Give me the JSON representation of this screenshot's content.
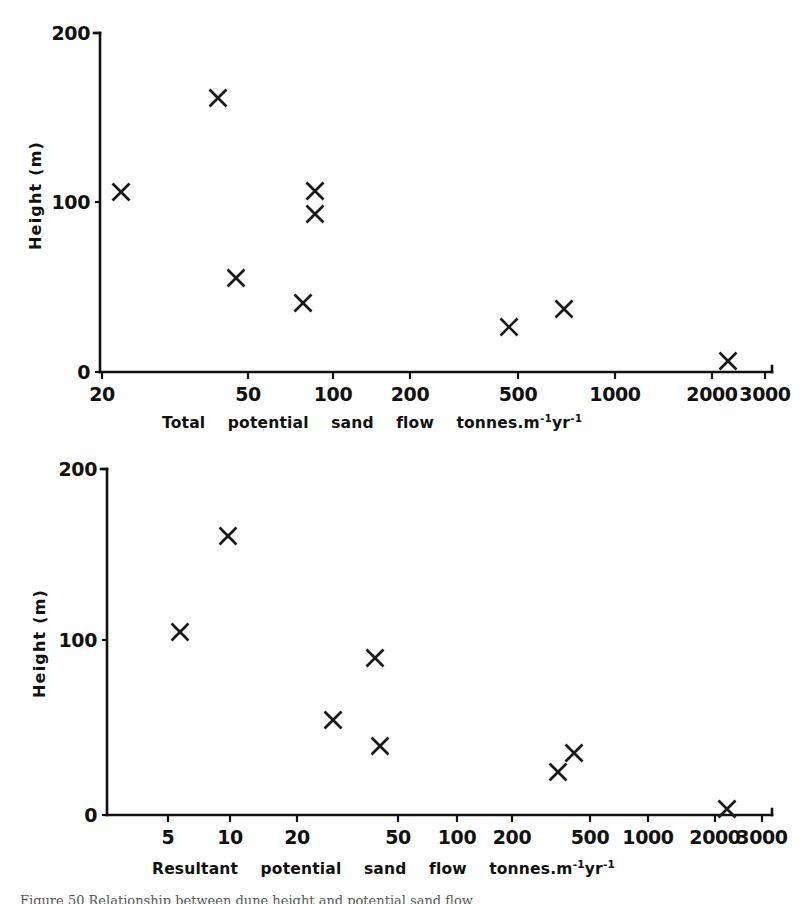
{
  "figure": {
    "caption": "Figure 50  Relationship between dune height and potential sand flow",
    "marker_glyph": "x-cross-marker",
    "ink_color": "#111111",
    "background_color": "#ffffff"
  },
  "chart_data": [
    {
      "id": "top",
      "type": "scatter",
      "title": "",
      "xlabel": "Total  potential  sand  flow   tonnes.m-1 yr-1",
      "xlabel_parts": [
        "Total",
        "potential",
        "sand",
        "flow",
        "tonnes.m"
      ],
      "xlabel_sup1": "-1",
      "xlabel_mid": "yr",
      "xlabel_sup2": "-1",
      "ylabel": "Height  (m)",
      "xscale": "log",
      "yscale": "linear",
      "xlim": [
        20,
        3000
      ],
      "ylim": [
        0,
        200
      ],
      "grid": false,
      "legend": "none",
      "xticks": [
        20,
        50,
        100,
        200,
        500,
        1000,
        2000,
        3000
      ],
      "xtick_labels": [
        "20",
        "50",
        "100",
        "200",
        "500",
        "1000",
        "2000",
        "3000"
      ],
      "xtick_px": [
        102,
        248,
        333,
        410,
        518,
        615,
        712,
        765
      ],
      "yticks": [
        0,
        100,
        200
      ],
      "ytick_labels": [
        "0",
        "100",
        "200"
      ],
      "ytick_px": [
        372,
        202,
        33
      ],
      "axis_x_px": 100,
      "axis_y0_px": 372,
      "axis_y_top_px": 33,
      "axis_x_right_px": 772,
      "points": [
        {
          "x": 25,
          "y": 105,
          "px": 121,
          "py": 192
        },
        {
          "x": 40,
          "y": 159,
          "px": 218,
          "py": 98
        },
        {
          "x": 45,
          "y": 54,
          "px": 236,
          "py": 278
        },
        {
          "x": 80,
          "y": 40,
          "px": 303,
          "py": 303
        },
        {
          "x": 88,
          "y": 106,
          "px": 315,
          "py": 191
        },
        {
          "x": 88,
          "y": 92,
          "px": 315,
          "py": 214
        },
        {
          "x": 470,
          "y": 27,
          "px": 509,
          "py": 327
        },
        {
          "x": 730,
          "y": 37,
          "px": 564,
          "py": 309
        },
        {
          "x": 2300,
          "y": 4,
          "px": 728,
          "py": 361
        }
      ]
    },
    {
      "id": "bottom",
      "type": "scatter",
      "title": "",
      "xlabel": "Resultant  potential  sand  flow   tonnes.m-1 yr-1",
      "xlabel_parts": [
        "Resultant",
        "potential",
        "sand",
        "flow",
        "tonnes.m"
      ],
      "xlabel_sup1": "-1",
      "xlabel_mid": "yr",
      "xlabel_sup2": "-1",
      "ylabel": "Height  (m)",
      "xscale": "log",
      "yscale": "linear",
      "xlim": [
        3,
        3000
      ],
      "ylim": [
        0,
        200
      ],
      "grid": false,
      "legend": "none",
      "xticks": [
        5,
        10,
        20,
        50,
        100,
        200,
        500,
        1000,
        2000,
        3000
      ],
      "xtick_labels": [
        "5",
        "10",
        "20",
        "50",
        "100",
        "200",
        "500",
        "1000",
        "2000",
        "3000"
      ],
      "xtick_px": [
        168,
        230,
        297,
        398,
        457,
        512,
        590,
        648,
        715,
        762
      ],
      "yticks": [
        0,
        100,
        200
      ],
      "ytick_labels": [
        "0",
        "100",
        "200"
      ],
      "ytick_px": [
        815,
        640,
        469
      ],
      "axis_x_px": 107,
      "axis_y0_px": 815,
      "axis_y_top_px": 469,
      "axis_x_right_px": 772,
      "points": [
        {
          "x": 6,
          "y": 105,
          "px": 180,
          "py": 632
        },
        {
          "x": 10,
          "y": 159,
          "px": 228,
          "py": 536
        },
        {
          "x": 27,
          "y": 54,
          "px": 333,
          "py": 720
        },
        {
          "x": 40,
          "y": 92,
          "px": 375,
          "py": 658
        },
        {
          "x": 42,
          "y": 40,
          "px": 380,
          "py": 746
        },
        {
          "x": 300,
          "y": 26,
          "px": 558,
          "py": 772
        },
        {
          "x": 380,
          "y": 37,
          "px": 574,
          "py": 753
        },
        {
          "x": 2300,
          "y": 3,
          "px": 727,
          "py": 809
        }
      ]
    }
  ]
}
